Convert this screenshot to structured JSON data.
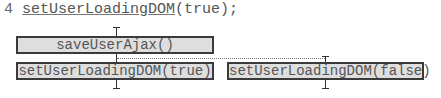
{
  "code_line": {
    "line_number": "4",
    "function_call": "setUserLoadingDOM",
    "rest": "(true);"
  },
  "diagram": {
    "top_box": {
      "label": "saveUserAjax()"
    },
    "left_box": {
      "label": "setUserLoadingDOM(true)"
    },
    "right_box": {
      "label": "setUserLoadingDOM(false)"
    },
    "colors": {
      "box_fill": "#dedede",
      "box_border": "#3a3a3a",
      "text": "#555555",
      "connector": "#333333",
      "dotted": "#777777"
    }
  }
}
